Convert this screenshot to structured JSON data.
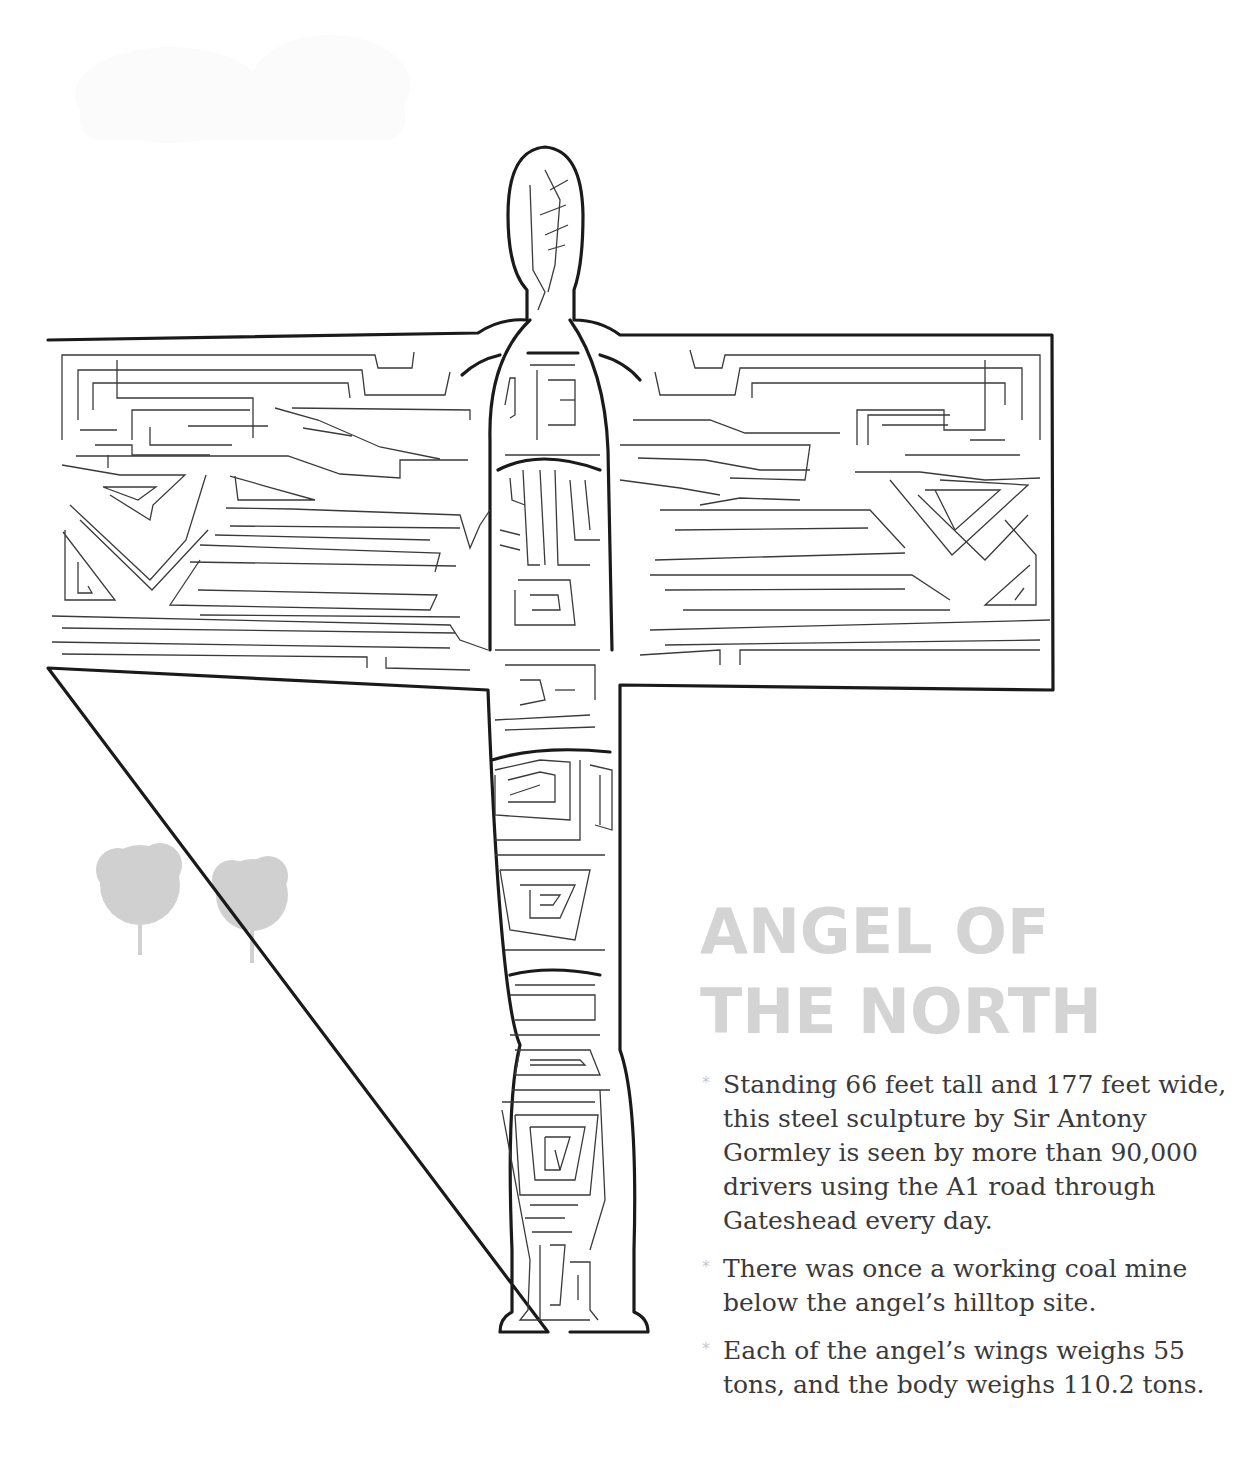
{
  "page": {
    "title": "ANGEL OF\nTHE NORTH",
    "colors": {
      "title": "#d4d4d4",
      "body_text": "#3a3a3a",
      "bullet": "#c8c8c8",
      "maze_outline": "#1a1a1a",
      "maze_walls": "#3a3a3a",
      "trees": "#d0d0d0",
      "cloud": "#fbfbfb"
    },
    "illustration": {
      "subject": "Angel of the North sculpture maze",
      "decorations": [
        "cloud",
        "tree",
        "tree"
      ]
    },
    "facts": [
      {
        "bullet": "*",
        "text": "Standing 66 feet tall and 177 feet wide, this steel sculpture by Sir Antony Gormley is seen by more than 90,000 drivers using the A1 road through Gateshead every day."
      },
      {
        "bullet": "*",
        "text": "There was once a working coal mine below the angel’s hilltop site."
      },
      {
        "bullet": "*",
        "text": "Each of the angel’s wings weighs 55 tons, and the body weighs 110.2 tons."
      }
    ]
  }
}
